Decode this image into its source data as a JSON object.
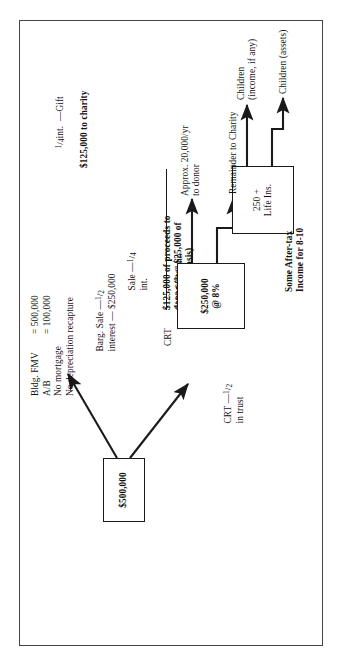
{
  "document": {
    "type": "financial-planning-flowchart",
    "orientation": "landscape-rotated-90ccw",
    "ink_color": "#111111",
    "paper_color": "#ffffff"
  },
  "nodes": {
    "principal_box": {
      "label": "$500,000"
    },
    "crt_caption": "CRT",
    "crt_box": {
      "line1": "$250,000",
      "line2": "@ 8%"
    },
    "life_ins_box": {
      "line1": "250 +",
      "line2": "Life Ins."
    }
  },
  "branches": {
    "crt_branch_label_pre": "CRT —",
    "crt_branch_fraction": "1/2",
    "crt_branch_label_post": "in trust",
    "barg_branch_label_pre": "Barg. Sale —",
    "barg_branch_fraction": "1/2",
    "barg_branch_label_post": "interest — $250,000"
  },
  "facts": {
    "rows": [
      {
        "term": "Bldg. FMV",
        "value": "= 500,000"
      },
      {
        "term": "A/B",
        "value": "= 100,000"
      }
    ],
    "note1": "No mortgage",
    "note2": "No depreciation recapture"
  },
  "sale_block": {
    "line1_pre": "Sale —",
    "line1_fraction": "1/4",
    "line1_post": "int.",
    "line2": "$125,000 of proceeds to",
    "line3": "donor (less $25,000 of",
    "line4": "allocated basis)",
    "total": "$100,000 Gain"
  },
  "gift_block": {
    "line1_fraction": "1/4",
    "line1_post": "int.  —Gift",
    "line2": "$125,000 to charity"
  },
  "flows": {
    "approx_to_donor_line1": "Approx. 20,000/yr",
    "approx_to_donor_line2": "to donor",
    "remainder_to_charity": "Remainder to Charity",
    "after_tax_line1": "Some After-tax",
    "after_tax_line2": "Income for 8-10",
    "children_income_line1": "Children",
    "children_income_line2": "(income, if any)",
    "children_assets": "Children (assets)"
  }
}
